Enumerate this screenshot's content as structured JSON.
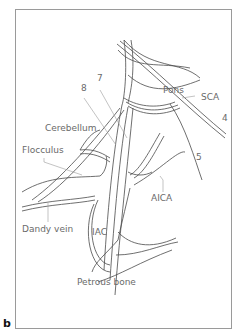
{
  "figure": {
    "panel_label": "b",
    "labels": {
      "pons": "Pons",
      "sca": "SCA",
      "nerve4": "4",
      "nerve7": "7",
      "nerve8": "8",
      "cerebellum": "Cerebellum",
      "flocculus": "Flocculus",
      "nerve5": "5",
      "aica": "AICA",
      "dandy_vein": "Dandy vein",
      "iac": "IAC",
      "petrous_bone": "Petrous bone"
    },
    "colors": {
      "line": "#4a4a4a",
      "leader": "#9a9a9a",
      "text": "#6a6a6a",
      "frame": "#9a9a9a"
    }
  }
}
